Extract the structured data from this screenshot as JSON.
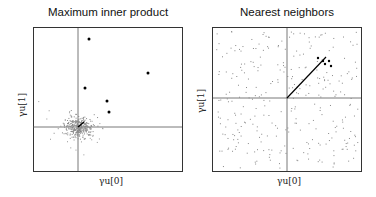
{
  "chart_data": [
    {
      "type": "scatter",
      "title": "Maximum inner product",
      "xlabel": "γu[0]",
      "ylabel": "γu[1]",
      "grid": false,
      "axes_cross_at_origin": true,
      "series": [
        {
          "name": "points",
          "color": "#888888",
          "description": "dense gray cluster centered near origin"
        },
        {
          "name": "top results",
          "color": "#000000",
          "points": [
            [
              0.2,
              0.85
            ],
            [
              1.2,
              0.55
            ],
            [
              0.12,
              0.38
            ],
            [
              0.5,
              0.25
            ],
            [
              0.52,
              0.15
            ]
          ]
        },
        {
          "name": "query vector",
          "color": "#000000",
          "from": [
            0,
            0
          ],
          "to": [
            0.1,
            0.07
          ]
        }
      ]
    },
    {
      "type": "scatter",
      "title": "Nearest neighbors",
      "xlabel": "γu[0]",
      "ylabel": "γu[1]",
      "grid": false,
      "axes_cross_at_origin": true,
      "series": [
        {
          "name": "points",
          "color": "#888888",
          "description": "uniformly spread gray points"
        },
        {
          "name": "top results",
          "color": "#000000",
          "points": [
            [
              0.58,
              0.52
            ],
            [
              0.66,
              0.49
            ],
            [
              0.72,
              0.48
            ],
            [
              0.68,
              0.45
            ],
            [
              0.7,
              0.43
            ]
          ]
        },
        {
          "name": "query vector",
          "color": "#000000",
          "from": [
            0,
            0
          ],
          "to": [
            0.7,
            0.55
          ]
        }
      ]
    }
  ],
  "panels": {
    "left": {
      "title": "Maximum inner product",
      "xlabel": "γu[0]",
      "ylabel": "γu[1]"
    },
    "right": {
      "title": "Nearest neighbors",
      "xlabel": "γu[0]",
      "ylabel": "γu[1]"
    }
  }
}
